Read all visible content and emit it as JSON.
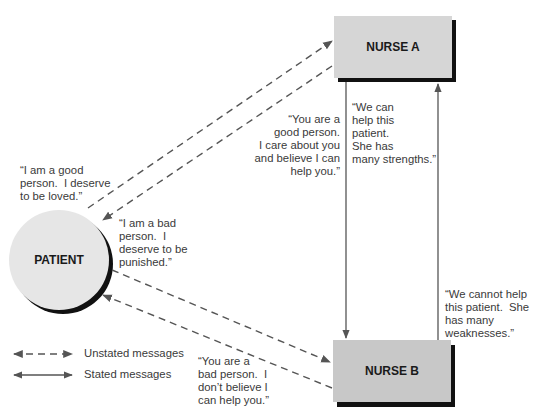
{
  "nodes": {
    "nurse_a": {
      "label": "NURSE A"
    },
    "nurse_b": {
      "label": "NURSE B"
    },
    "patient": {
      "label": "PATIENT"
    }
  },
  "messages": {
    "patient_good": "“I am a good\nperson.  I deserve\nto be loved.”",
    "patient_bad": "“I am a bad\nperson.  I\ndeserve to be\npunished.”",
    "nurse_a_to_patient": "“You are a\ngood person.\nI care about you\nand believe I can\nhelp you.”",
    "nurse_a_to_b": "“We can\nhelp this\npatient.\nShe has\nmany strengths.”",
    "nurse_b_to_a": "“We cannot help\nthis patient.  She\nhas many\nweaknesses.”",
    "nurse_b_to_patient": "“You are a\nbad person.  I\ndon’t believe I\ncan help you.”"
  },
  "legend": {
    "unstated": "Unstated messages",
    "stated": "Stated messages"
  },
  "colors": {
    "box_fill": "#d4d4d4",
    "box_fill_b": "#c6c6c6",
    "circle_fill": "#e4e4e4",
    "shadow": "#111111",
    "line": "#555555"
  }
}
